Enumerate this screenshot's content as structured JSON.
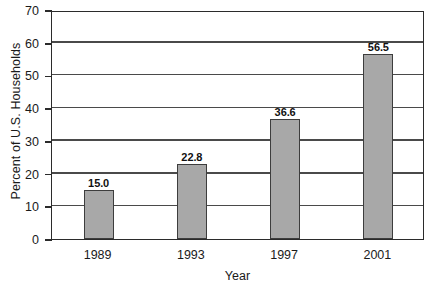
{
  "chart_data": {
    "type": "bar",
    "title": "",
    "subtitle": "",
    "xlabel": "Year",
    "ylabel": "Percent of U.S. Households",
    "categories": [
      "1989",
      "1993",
      "1997",
      "2001"
    ],
    "values": [
      15.0,
      22.8,
      36.6,
      56.5
    ],
    "value_labels": [
      "15.0",
      "22.8",
      "36.6",
      "56.5"
    ],
    "ylim": [
      0,
      70
    ],
    "ytick_labels": [
      "0",
      "10",
      "20",
      "30",
      "40",
      "50",
      "60",
      "70"
    ],
    "ytick_values": [
      0,
      10,
      20,
      30,
      40,
      50,
      60,
      70
    ],
    "grid": "horizontal",
    "legend": "none",
    "bar_color": "#a8a8a8",
    "bar_edge_color": "#3d3d3d",
    "axis_color": "#2b2b2b",
    "grid_color": "#4a4a4a",
    "background_color": "#ffffff"
  }
}
